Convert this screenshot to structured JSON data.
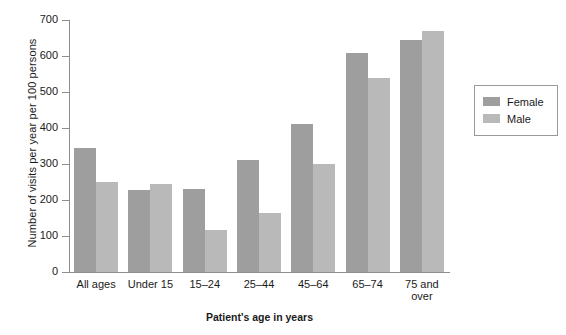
{
  "chart_data": {
    "type": "bar",
    "title": "",
    "xlabel": "Patient's age in years",
    "ylabel": "Number of visits per year per 100 persons",
    "categories": [
      "All ages",
      "Under 15",
      "15–24",
      "25–44",
      "45–64",
      "65–74",
      "75 and over"
    ],
    "series": [
      {
        "name": "Female",
        "color": "#9e9e9e",
        "values": [
          345,
          228,
          230,
          310,
          410,
          608,
          645
        ]
      },
      {
        "name": "Male",
        "color": "#b9b9b9",
        "values": [
          250,
          244,
          117,
          163,
          300,
          538,
          670
        ]
      }
    ],
    "ylim": [
      0,
      700
    ],
    "yticks": [
      0,
      100,
      200,
      300,
      400,
      500,
      600,
      700
    ],
    "ytick_labels": [
      "0",
      "100",
      "200",
      "300",
      "400",
      "500",
      "600",
      "700"
    ],
    "grid": false,
    "legend_position": "right"
  },
  "legend": {
    "entries": [
      {
        "label": "Female"
      },
      {
        "label": "Male"
      }
    ]
  }
}
